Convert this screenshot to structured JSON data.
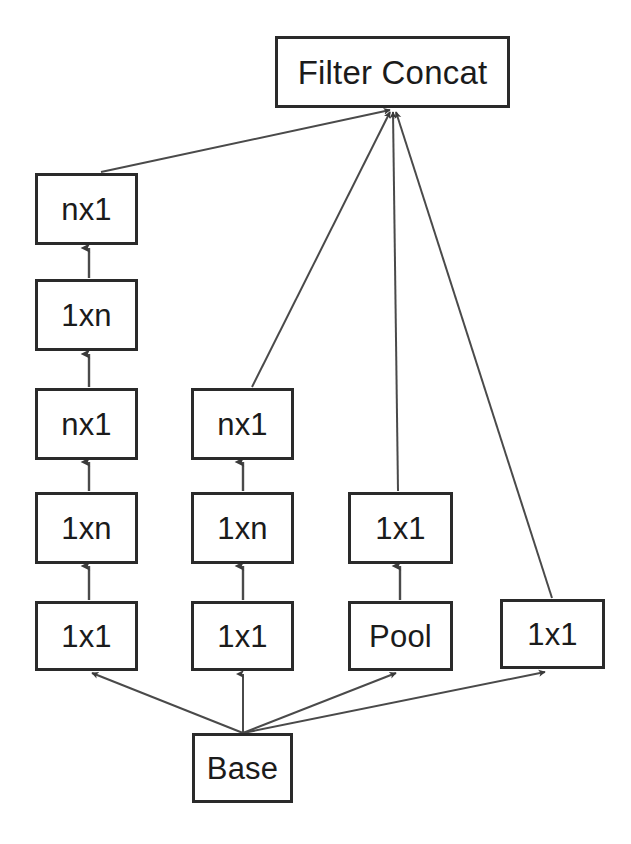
{
  "diagram": {
    "title_node": {
      "label": "Filter Concat",
      "name": "filter-concat"
    },
    "base_node": {
      "label": "Base",
      "name": "base"
    },
    "branch_a": {
      "name": "branch-factorized-deep",
      "nodes": [
        {
          "label": "nx1"
        },
        {
          "label": "1xn"
        },
        {
          "label": "nx1"
        },
        {
          "label": "1xn"
        },
        {
          "label": "1x1"
        }
      ]
    },
    "branch_b": {
      "name": "branch-factorized-shallow",
      "nodes": [
        {
          "label": "nx1"
        },
        {
          "label": "1xn"
        },
        {
          "label": "1x1"
        }
      ]
    },
    "branch_c": {
      "name": "branch-pool",
      "nodes": [
        {
          "label": "1x1"
        },
        {
          "label": "Pool"
        }
      ]
    },
    "branch_d": {
      "name": "branch-direct",
      "nodes": [
        {
          "label": "1x1"
        }
      ]
    },
    "colors": {
      "stroke": "#2a2a2a",
      "edge": "#4a4a4a",
      "fill": "#ffffff",
      "text": "#1b1b1b"
    }
  }
}
